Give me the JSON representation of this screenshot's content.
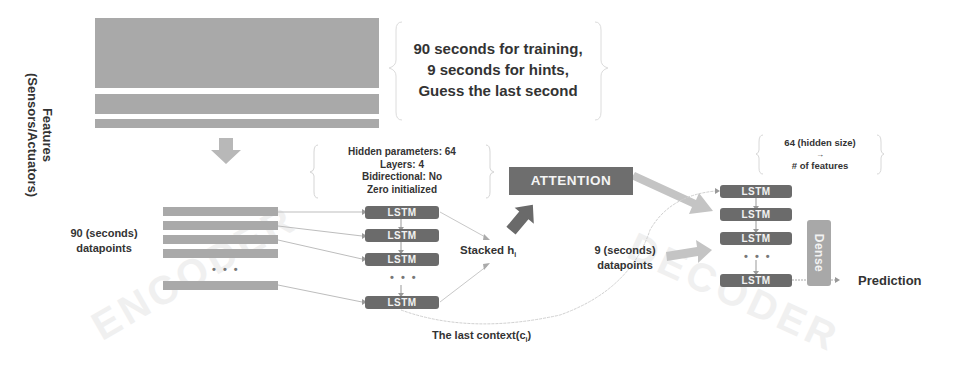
{
  "side_label": {
    "line1": "Features",
    "line2": "(Sensors/Actuators)"
  },
  "top_note": {
    "line1": "90 seconds for training,",
    "line2": "9 seconds for hints,",
    "line3": "Guess the last second"
  },
  "encoder": {
    "input_label_line1": "90 (seconds)",
    "input_label_line2": "datapoints",
    "config": {
      "line1": "Hidden parameters: 64",
      "line2": "Layers: 4",
      "line3": "Bidirectional: No",
      "line4": "Zero initialized"
    },
    "cells": [
      "LSTM",
      "LSTM",
      "LSTM",
      "LSTM"
    ],
    "ellipsis": "• • •",
    "stacked_label": "Stacked h",
    "stacked_sub": "i",
    "context_label": "The last context(c",
    "context_sub": "i",
    "context_close": ")",
    "watermark": "ENCODER"
  },
  "attention": {
    "label": "ATTENTION"
  },
  "decoder": {
    "note_line1": "64 (hidden size)",
    "note_arrow": "→",
    "note_line2": "# of features",
    "hint_label_line1": "9 (seconds)",
    "hint_label_line2": "datapoints",
    "cells": [
      "LSTM",
      "LSTM",
      "LSTM",
      "LSTM"
    ],
    "ellipsis": "• • •",
    "dense_label": "Dense",
    "output_label": "Prediction",
    "watermark": "DECODER"
  },
  "colors": {
    "bar": "#a9a9a9",
    "lstm": "#6b6b6b",
    "attention": "#6e6e6e",
    "arrow_light": "#c4c4c4",
    "arrow_dark": "#6a6a6a",
    "text": "#333333"
  }
}
